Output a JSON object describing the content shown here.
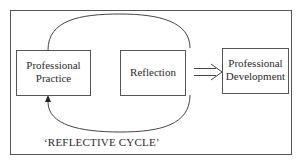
{
  "diagram": {
    "nodes": [
      {
        "id": "practice",
        "lines": [
          "Professional",
          "Practice"
        ]
      },
      {
        "id": "reflection",
        "lines": [
          "Reflection"
        ]
      },
      {
        "id": "development",
        "lines": [
          "Professional",
          "Development"
        ]
      }
    ],
    "edges": [
      {
        "from": "practice",
        "to": "reflection",
        "style": "curved loop (top)"
      },
      {
        "from": "reflection",
        "to": "practice",
        "style": "curved loop (bottom) with arrowhead"
      },
      {
        "from": "reflection",
        "to": "development",
        "style": "double-line arrow"
      }
    ],
    "caption": "‘REFLECTIVE CYCLE’"
  }
}
